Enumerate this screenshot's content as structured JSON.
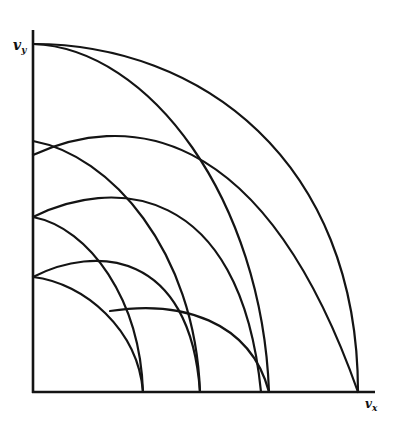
{
  "figure": {
    "type": "velocity-space contour diagram",
    "stroke_color": "#141414",
    "background": "#ffffff",
    "axes": {
      "origin": [
        33,
        392
      ],
      "y_axis": {
        "label_main": "v",
        "label_sub": "y",
        "top": 44
      },
      "x_axis": {
        "label_main": "v",
        "label_sub": "x",
        "right": 375
      }
    },
    "curves": [
      {
        "id": "outer-arc",
        "d": "M33,44 C200,44 358,160 358,392"
      },
      {
        "id": "arc-top-to-269",
        "d": "M33,44 C150,48 262,200 269,392"
      },
      {
        "id": "arc-155-to-358",
        "d": "M33,155 C120,115 260,115 358,392"
      },
      {
        "id": "arc-141-to-200",
        "d": "M33,141 C110,155 195,250 200,392"
      },
      {
        "id": "arc-217-to-261",
        "d": "M33,217 C110,178 240,180 261,392"
      },
      {
        "id": "arc-217-to-143",
        "d": "M33,217 C90,228 140,300 143,392"
      },
      {
        "id": "arc-277-to-200",
        "d": "M33,277 C95,245 190,250 200,392"
      },
      {
        "id": "arc-277-to-143",
        "d": "M33,277 C85,283 138,330 143,392"
      },
      {
        "id": "arc-311-to-269",
        "d": "M110,311 C180,300 250,320 269,392"
      }
    ]
  }
}
